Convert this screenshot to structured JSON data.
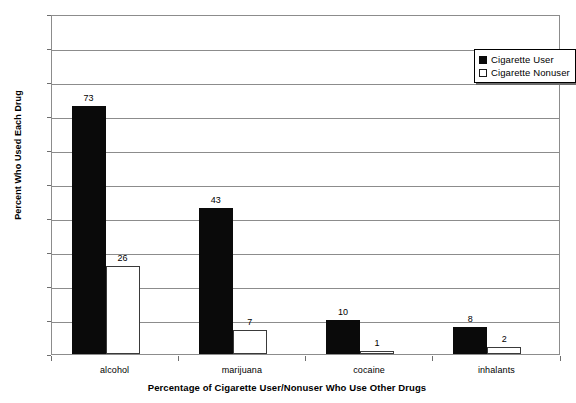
{
  "chart_data": {
    "type": "bar",
    "title": "",
    "xlabel": "Percentage of Cigarette User/Nonuser Who Use Other Drugs",
    "ylabel": "Percent Who Used Each Drug",
    "categories": [
      "alcohol",
      "marijuana",
      "cocaine",
      "inhalants"
    ],
    "series": [
      {
        "name": "Cigarette User",
        "values": [
          73,
          43,
          10,
          8
        ],
        "color": "#0a0a0a",
        "swatch": "filled"
      },
      {
        "name": "Cigarette Nonuser",
        "values": [
          26,
          7,
          1,
          2
        ],
        "color": "#ffffff",
        "swatch": "hollow"
      }
    ],
    "ylim": [
      0,
      100
    ],
    "ytick_step": 10,
    "yticks": [
      100,
      90,
      80,
      70,
      60,
      50,
      40,
      30,
      20,
      10,
      0
    ],
    "grid": true,
    "legend_position": "top-right",
    "data_labels": true
  },
  "legend": {
    "entries": [
      {
        "label": "Cigarette User",
        "swatch": "filled"
      },
      {
        "label": "Cigarette Nonuser",
        "swatch": "hollow"
      }
    ]
  },
  "axes": {
    "y_title": "Percent Who Used Each Drug",
    "x_title": "Percentage of Cigarette User/Nonuser Who Use Other Drugs"
  }
}
